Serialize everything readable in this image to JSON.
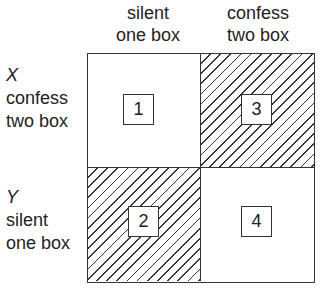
{
  "columns": [
    {
      "line1": "silent",
      "line2": "one box"
    },
    {
      "line1": "confess",
      "line2": "two box"
    }
  ],
  "rows": [
    {
      "var": "X",
      "line1": "confess",
      "line2": "two box"
    },
    {
      "var": "Y",
      "line1": "silent",
      "line2": "one box"
    }
  ],
  "cells": [
    {
      "number": "1",
      "hatched": false
    },
    {
      "number": "3",
      "hatched": true
    },
    {
      "number": "2",
      "hatched": true
    },
    {
      "number": "4",
      "hatched": false
    }
  ],
  "colors": {
    "line": "#333333",
    "text": "#222222",
    "background": "#ffffff"
  }
}
